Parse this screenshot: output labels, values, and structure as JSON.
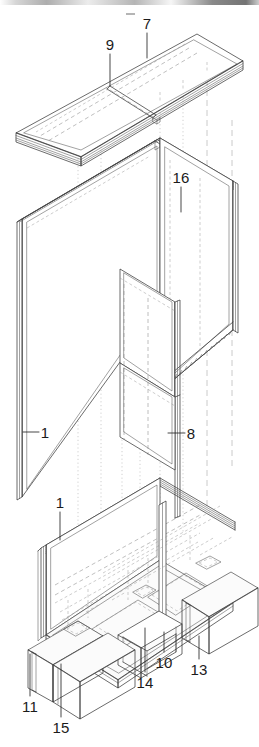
{
  "figure": {
    "kind": "exploded-isometric-assembly-drawing",
    "title_visible": false,
    "background_color": "#ffffff",
    "line_color": "#3a3a3a",
    "hidden_line_color": "#8a8a8a",
    "label_color": "#1b1b1b",
    "width_px": 259,
    "height_px": 747,
    "projection": "isometric",
    "artifact": {
      "name": "top-scan-smudge",
      "present": true
    }
  },
  "reference_labels": [
    {
      "id": "label-7",
      "text": "7",
      "x": 147,
      "y": 29,
      "leader": {
        "from_x": 147,
        "from_y": 33,
        "to_x": 147,
        "to_y": 58
      }
    },
    {
      "id": "label-9",
      "text": "9",
      "x": 110,
      "y": 50,
      "leader": {
        "from_x": 110,
        "from_y": 54,
        "to_x": 110,
        "to_y": 86
      }
    },
    {
      "id": "label-16",
      "text": "16",
      "x": 181,
      "y": 183,
      "leader": {
        "from_x": 181,
        "from_y": 187,
        "to_x": 181,
        "to_y": 212
      }
    },
    {
      "id": "label-1-upper",
      "text": "1",
      "x": 45,
      "y": 438,
      "leader": {
        "from_x": 39,
        "from_y": 432,
        "to_x": 23,
        "to_y": 432
      }
    },
    {
      "id": "label-8",
      "text": "8",
      "x": 191,
      "y": 439,
      "leader": {
        "from_x": 185,
        "from_y": 433,
        "to_x": 168,
        "to_y": 433
      }
    },
    {
      "id": "label-1-lower",
      "text": "1",
      "x": 60,
      "y": 508,
      "leader": {
        "from_x": 60,
        "from_y": 512,
        "to_x": 60,
        "to_y": 540
      }
    },
    {
      "id": "label-10",
      "text": "10",
      "x": 164,
      "y": 668,
      "leader": {
        "from_x": 164,
        "from_y": 652,
        "to_x": 164,
        "to_y": 632
      }
    },
    {
      "id": "label-13",
      "text": "13",
      "x": 199,
      "y": 675,
      "leader": {
        "from_x": 199,
        "from_y": 659,
        "to_x": 199,
        "to_y": 636
      }
    },
    {
      "id": "label-14",
      "text": "14",
      "x": 145,
      "y": 688,
      "leader": {
        "from_x": 145,
        "from_y": 672,
        "to_x": 145,
        "to_y": 628
      }
    },
    {
      "id": "label-11",
      "text": "11",
      "x": 30,
      "y": 712,
      "leader": {
        "from_x": 30,
        "from_y": 696,
        "to_x": 30,
        "to_y": 654
      }
    },
    {
      "id": "label-15",
      "text": "15",
      "x": 61,
      "y": 733,
      "leader": {
        "from_x": 61,
        "from_y": 717,
        "to_x": 61,
        "to_y": 664
      }
    }
  ],
  "components": [
    {
      "id": "top-panel",
      "ref": "7",
      "name": "top panel / worktop slab",
      "description": "flat rectangular slab shown exploded above the assembly"
    },
    {
      "id": "top-panel-divider",
      "ref": "9",
      "name": "top panel cross divider",
      "description": "transverse rib dividing the top slab into two bays"
    },
    {
      "id": "left-side-panel",
      "ref": "1",
      "name": "left side panel",
      "description": "upright rectangular side wall, left hand"
    },
    {
      "id": "right-side-panel",
      "ref": "16",
      "name": "right side panel with hatched sill",
      "description": "upright rectangular side wall, right hand, serrated lower edge"
    },
    {
      "id": "center-divider",
      "ref": "8",
      "name": "centre vertical divider panel",
      "description": "inner partition between the two bays"
    },
    {
      "id": "base-side-panel",
      "ref": "1",
      "name": "base frame side panel",
      "description": "lower upright wall of the base assembly"
    },
    {
      "id": "base-rail",
      "ref": "10",
      "name": "base support rail / post",
      "description": "vertical post at the centre of the plinth"
    },
    {
      "id": "plinth-box-right",
      "ref": "13",
      "name": "right plinth box / foot",
      "description": "box-shaped foot at the right"
    },
    {
      "id": "plinth-bracket",
      "ref": "14",
      "name": "plinth connecting bracket",
      "description": "open U bracket between the feet"
    },
    {
      "id": "plinth-box-left",
      "ref": "11",
      "name": "left plinth box / foot",
      "description": "box-shaped foot at the left"
    },
    {
      "id": "plinth-box-front",
      "ref": "15",
      "name": "front plinth box / foot",
      "description": "box-shaped foot at the front"
    }
  ]
}
